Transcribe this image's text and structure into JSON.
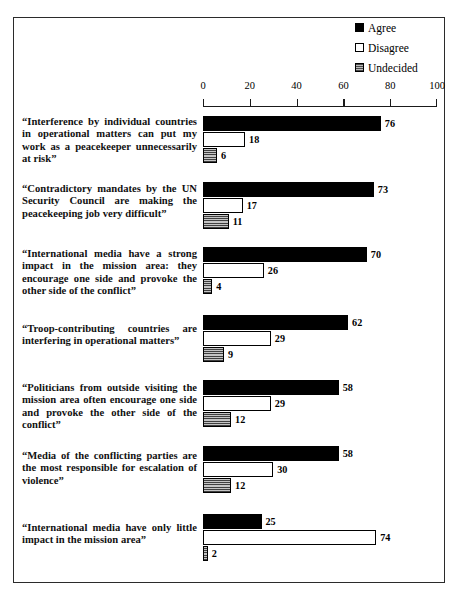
{
  "legend": {
    "items": [
      {
        "label": "Agree",
        "icon": "filled-square-icon",
        "color": "#000000"
      },
      {
        "label": "Disagree",
        "icon": "hollow-square-icon",
        "color": "#ffffff"
      },
      {
        "label": "Undecided",
        "icon": "hatched-square-icon",
        "color": "#8d8d8d"
      }
    ]
  },
  "axis": {
    "ticks": [
      "0",
      "20",
      "40",
      "60",
      "80",
      "100"
    ]
  },
  "chart_data": {
    "type": "bar",
    "orientation": "horizontal",
    "title": "",
    "xlabel": "",
    "ylabel": "",
    "xlim": [
      0,
      100
    ],
    "grid": false,
    "legend_position": "top-right",
    "xticks": [
      0,
      20,
      40,
      60,
      80,
      100
    ],
    "categories": [
      "“Interference by individual countries in operational matters can put my work as a peacekeeper unnecessarily at risk”",
      "“Contradictory mandates by the UN Security Council are making the peacekeeping job very difficult”",
      "“International media have a strong impact in the mission area: they encourage one side and provoke the other side of the conflict”",
      "“Troop-contributing countries are interfering in operational matters”",
      "“Politicians from outside visiting the mission area often encourage one side and provoke the other side of the conflict”",
      "“Media of the conflicting parties are the most responsible for escalation of  violence”",
      "“International media have only little impact in the mission area”"
    ],
    "series": [
      {
        "name": "Agree",
        "values": [
          76,
          73,
          70,
          62,
          58,
          58,
          25
        ]
      },
      {
        "name": "Disagree",
        "values": [
          18,
          17,
          26,
          29,
          29,
          30,
          74
        ]
      },
      {
        "name": "Undecided",
        "values": [
          6,
          11,
          4,
          9,
          12,
          12,
          2
        ]
      }
    ]
  },
  "groups": [
    {
      "label": "“Interference by individual countries in operational matters can put my work as a peacekeeper unnecessarily at risk”",
      "bars": [
        {
          "series": "Agree",
          "value": "76"
        },
        {
          "series": "Disagree",
          "value": "18"
        },
        {
          "series": "Undecided",
          "value": "6"
        }
      ]
    },
    {
      "label": "“Contradictory mandates by the UN Security Council are making the peacekeeping job very difficult”",
      "bars": [
        {
          "series": "Agree",
          "value": "73"
        },
        {
          "series": "Disagree",
          "value": "17"
        },
        {
          "series": "Undecided",
          "value": "11"
        }
      ]
    },
    {
      "label": "“International media have a strong impact in the mission area: they encourage one side and provoke the other side of the conflict”",
      "bars": [
        {
          "series": "Agree",
          "value": "70"
        },
        {
          "series": "Disagree",
          "value": "26"
        },
        {
          "series": "Undecided",
          "value": "4"
        }
      ]
    },
    {
      "label": "“Troop-contributing countries are interfering in operational matters”",
      "bars": [
        {
          "series": "Agree",
          "value": "62"
        },
        {
          "series": "Disagree",
          "value": "29"
        },
        {
          "series": "Undecided",
          "value": "9"
        }
      ]
    },
    {
      "label": "“Politicians from outside visiting the mission area often encourage one side and provoke the other side of the conflict”",
      "bars": [
        {
          "series": "Agree",
          "value": "58"
        },
        {
          "series": "Disagree",
          "value": "29"
        },
        {
          "series": "Undecided",
          "value": "12"
        }
      ]
    },
    {
      "label": "“Media of the conflicting parties are the most responsible for escalation of  violence”",
      "bars": [
        {
          "series": "Agree",
          "value": "58"
        },
        {
          "series": "Disagree",
          "value": "30"
        },
        {
          "series": "Undecided",
          "value": "12"
        }
      ]
    },
    {
      "label": "“International media have only little impact in the mission area”",
      "bars": [
        {
          "series": "Agree",
          "value": "25"
        },
        {
          "series": "Disagree",
          "value": "74"
        },
        {
          "series": "Undecided",
          "value": "2"
        }
      ]
    }
  ]
}
